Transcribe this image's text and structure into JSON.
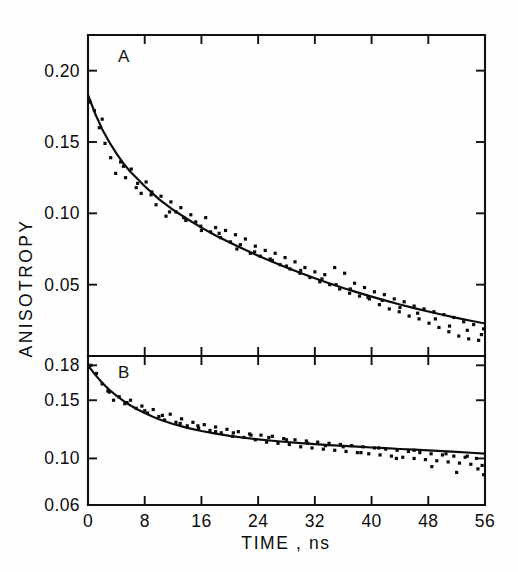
{
  "figure": {
    "background_color": "#fefefe",
    "ink_color": "#0b0b0b",
    "y_axis_title": "ANISOTROPY",
    "x_axis_title": "TIME , ns"
  },
  "chart_data": [
    {
      "type": "scatter",
      "panel_label": "A",
      "title": "",
      "xlabel": "TIME , ns",
      "ylabel": "ANISOTROPY",
      "xlim": [
        0,
        56
      ],
      "ylim": [
        0.0,
        0.225
      ],
      "xticks": [
        0,
        8,
        16,
        24,
        32,
        40,
        48,
        56
      ],
      "xticklabels": [
        "0",
        "8",
        "16",
        "24",
        "32",
        "40",
        "48",
        "56"
      ],
      "yticks": [
        0.2,
        0.15,
        0.1,
        0.05
      ],
      "yticklabels": [
        "0.20",
        "0.15",
        "0.10",
        "0.05"
      ],
      "grid": false,
      "legend": "none",
      "series": [
        {
          "name": "fit",
          "kind": "line",
          "x": [
            0,
            1,
            2,
            3,
            4,
            5,
            6,
            7,
            8,
            9,
            10,
            12,
            14,
            16,
            18,
            20,
            22,
            24,
            26,
            28,
            30,
            32,
            34,
            36,
            38,
            40,
            42,
            44,
            46,
            48,
            50,
            52,
            54,
            56
          ],
          "y": [
            0.183,
            0.17,
            0.159,
            0.15,
            0.142,
            0.135,
            0.129,
            0.124,
            0.119,
            0.1145,
            0.11,
            0.1025,
            0.096,
            0.09,
            0.0845,
            0.0795,
            0.0748,
            0.0703,
            0.066,
            0.062,
            0.0582,
            0.0545,
            0.051,
            0.0477,
            0.0446,
            0.0416,
            0.0388,
            0.0361,
            0.0336,
            0.0312,
            0.0289,
            0.0267,
            0.0247,
            0.0228
          ]
        },
        {
          "name": "data",
          "kind": "points",
          "x": [
            0.3,
            0.9,
            1.6,
            2.4,
            3.2,
            3.9,
            4.6,
            5.3,
            6.1,
            6.8,
            7.5,
            8.2,
            8.9,
            9.6,
            10.3,
            11.0,
            11.7,
            12.4,
            13.1,
            13.8,
            14.5,
            15.2,
            15.9,
            16.6,
            17.3,
            18.0,
            18.7,
            19.4,
            20.1,
            20.8,
            21.5,
            22.2,
            22.9,
            23.6,
            24.3,
            25.0,
            25.7,
            26.4,
            27.1,
            27.8,
            28.5,
            29.2,
            29.9,
            30.6,
            31.3,
            32.0,
            32.7,
            33.4,
            34.1,
            34.8,
            35.5,
            36.2,
            36.9,
            37.6,
            38.3,
            39.0,
            39.7,
            40.4,
            41.1,
            41.8,
            42.5,
            43.2,
            43.9,
            44.6,
            45.3,
            46.0,
            46.7,
            47.4,
            48.1,
            48.8,
            49.5,
            50.2,
            50.9,
            51.6,
            52.3,
            53.0,
            53.7,
            54.4,
            55.1,
            55.8,
            2.0,
            5.0,
            7.0,
            9.0,
            11.5,
            13.5,
            16.0,
            18.5,
            21.0,
            23.5,
            26.0,
            28.0,
            30.0,
            33.0,
            35.0,
            37.0,
            39.5,
            41.5,
            44.0,
            46.5,
            49.0,
            51.0,
            53.5,
            55.5
          ],
          "y": [
            0.178,
            0.172,
            0.16,
            0.149,
            0.139,
            0.128,
            0.136,
            0.125,
            0.131,
            0.118,
            0.114,
            0.122,
            0.113,
            0.106,
            0.112,
            0.098,
            0.108,
            0.101,
            0.104,
            0.095,
            0.099,
            0.094,
            0.091,
            0.097,
            0.087,
            0.09,
            0.083,
            0.088,
            0.08,
            0.085,
            0.078,
            0.082,
            0.072,
            0.077,
            0.07,
            0.074,
            0.068,
            0.072,
            0.064,
            0.069,
            0.061,
            0.066,
            0.058,
            0.062,
            0.055,
            0.059,
            0.052,
            0.057,
            0.05,
            0.062,
            0.047,
            0.058,
            0.044,
            0.051,
            0.042,
            0.048,
            0.04,
            0.045,
            0.036,
            0.043,
            0.033,
            0.04,
            0.031,
            0.038,
            0.028,
            0.035,
            0.026,
            0.033,
            0.023,
            0.031,
            0.02,
            0.029,
            0.017,
            0.027,
            0.014,
            0.024,
            0.012,
            0.022,
            0.011,
            0.019,
            0.166,
            0.133,
            0.121,
            0.115,
            0.101,
            0.097,
            0.088,
            0.086,
            0.075,
            0.073,
            0.067,
            0.063,
            0.06,
            0.054,
            0.05,
            0.047,
            0.041,
            0.039,
            0.034,
            0.03,
            0.026,
            0.021,
            0.018,
            0.015
          ]
        }
      ]
    },
    {
      "type": "scatter",
      "panel_label": "B",
      "title": "",
      "xlabel": "TIME , ns",
      "ylabel": "ANISOTROPY",
      "xlim": [
        0,
        56
      ],
      "ylim": [
        0.06,
        0.188
      ],
      "xticks": [
        0,
        8,
        16,
        24,
        32,
        40,
        48,
        56
      ],
      "xticklabels": [
        "0",
        "8",
        "16",
        "24",
        "32",
        "40",
        "48",
        "56"
      ],
      "yticks": [
        0.18,
        0.15,
        0.1,
        0.06
      ],
      "yticklabels": [
        "0.18",
        "0.15",
        "0.10",
        "0.06"
      ],
      "grid": false,
      "legend": "none",
      "series": [
        {
          "name": "fit",
          "kind": "line",
          "x": [
            0,
            1,
            2,
            3,
            4,
            5,
            6,
            7,
            8,
            9,
            10,
            12,
            14,
            16,
            18,
            20,
            22,
            24,
            26,
            28,
            30,
            32,
            34,
            36,
            38,
            40,
            42,
            44,
            46,
            48,
            50,
            52,
            54,
            56
          ],
          "y": [
            0.18,
            0.172,
            0.165,
            0.159,
            0.154,
            0.1495,
            0.1455,
            0.142,
            0.139,
            0.1362,
            0.1337,
            0.1296,
            0.1263,
            0.1236,
            0.1213,
            0.1194,
            0.1178,
            0.1164,
            0.1152,
            0.1141,
            0.1132,
            0.1123,
            0.1115,
            0.1108,
            0.1101,
            0.1094,
            0.1088,
            0.1081,
            0.1075,
            0.1069,
            0.1062,
            0.1056,
            0.1049,
            0.1042
          ]
        },
        {
          "name": "data",
          "kind": "points",
          "x": [
            0.4,
            1.2,
            2.0,
            2.8,
            3.6,
            4.4,
            5.2,
            6.0,
            6.8,
            7.6,
            8.4,
            9.2,
            10.0,
            10.8,
            11.6,
            12.4,
            13.2,
            14.0,
            14.8,
            15.6,
            16.4,
            17.2,
            18.0,
            18.8,
            19.6,
            20.4,
            21.2,
            22.0,
            22.8,
            23.6,
            24.4,
            25.2,
            26.0,
            26.8,
            27.6,
            28.4,
            29.2,
            30.0,
            30.8,
            31.6,
            32.4,
            33.2,
            34.0,
            34.8,
            35.6,
            36.4,
            37.2,
            38.0,
            38.8,
            39.6,
            40.4,
            41.2,
            42.0,
            42.8,
            43.6,
            44.4,
            45.2,
            46.0,
            46.8,
            47.6,
            48.4,
            49.2,
            50.0,
            50.8,
            51.6,
            52.4,
            53.2,
            54.0,
            54.8,
            55.6,
            3.0,
            5.5,
            8.0,
            10.5,
            13.0,
            15.5,
            18.0,
            20.5,
            23.0,
            25.5,
            28.0,
            31.0,
            33.5,
            36.0,
            38.5,
            41.0,
            43.5,
            46.0,
            48.5,
            50.5,
            52.0,
            53.5,
            55.0,
            55.8
          ],
          "y": [
            0.18,
            0.173,
            0.164,
            0.158,
            0.15,
            0.153,
            0.147,
            0.15,
            0.143,
            0.145,
            0.139,
            0.142,
            0.136,
            0.133,
            0.138,
            0.131,
            0.134,
            0.128,
            0.131,
            0.126,
            0.129,
            0.124,
            0.127,
            0.122,
            0.125,
            0.119,
            0.123,
            0.118,
            0.121,
            0.116,
            0.12,
            0.114,
            0.119,
            0.113,
            0.117,
            0.112,
            0.116,
            0.11,
            0.115,
            0.109,
            0.114,
            0.108,
            0.113,
            0.107,
            0.112,
            0.106,
            0.111,
            0.105,
            0.11,
            0.104,
            0.109,
            0.103,
            0.108,
            0.102,
            0.107,
            0.101,
            0.106,
            0.1,
            0.105,
            0.099,
            0.104,
            0.098,
            0.103,
            0.097,
            0.102,
            0.096,
            0.101,
            0.095,
            0.1,
            0.094,
            0.157,
            0.148,
            0.141,
            0.137,
            0.13,
            0.128,
            0.123,
            0.122,
            0.12,
            0.118,
            0.116,
            0.113,
            0.111,
            0.11,
            0.105,
            0.109,
            0.1,
            0.107,
            0.093,
            0.104,
            0.088,
            0.102,
            0.091,
            0.086
          ]
        }
      ]
    }
  ]
}
